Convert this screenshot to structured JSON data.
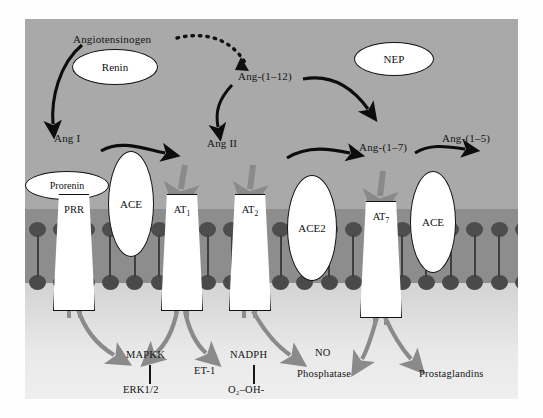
{
  "diagram": {
    "colors": {
      "panel_bg": "#a8a8a8",
      "membrane_band": "#8d8d8d",
      "lipid_head": "#4d4d4d",
      "cytoplasm": "#e9e9e9",
      "black_arrow": "#0d0d0d",
      "gray_arrow": "#8a8a8a"
    },
    "substrates": [
      {
        "id": "angiotensinogen",
        "label": "Angiotensinogen"
      },
      {
        "id": "ang_1_12",
        "label": "Ang-(1–12)"
      },
      {
        "id": "ang_i",
        "label": "Ang I"
      },
      {
        "id": "ang_ii",
        "label": "Ang II"
      },
      {
        "id": "ang_1_7",
        "label": "Ang-(1–7)"
      },
      {
        "id": "ang_1_5",
        "label": "Ang-(1–5)"
      }
    ],
    "enzymes": [
      {
        "id": "renin",
        "label": "Renin",
        "shape": "ellipse"
      },
      {
        "id": "nep",
        "label": "NEP",
        "shape": "ellipse"
      },
      {
        "id": "prorenin",
        "label": "Prorenin",
        "shape": "ellipse-outline"
      },
      {
        "id": "ace_left",
        "label": "ACE",
        "shape": "ellipse"
      },
      {
        "id": "ace2",
        "label": "ACE2",
        "shape": "ellipse"
      },
      {
        "id": "ace_right",
        "label": "ACE",
        "shape": "ellipse"
      }
    ],
    "receptors": [
      {
        "id": "prr",
        "label": "PRR",
        "sub": ""
      },
      {
        "id": "at1",
        "label": "AT",
        "sub": "1"
      },
      {
        "id": "at2",
        "label": "AT",
        "sub": "2"
      },
      {
        "id": "at7",
        "label": "AT",
        "sub": "7"
      }
    ],
    "downstream": [
      {
        "id": "mapkk",
        "label": "MAPKK"
      },
      {
        "id": "erk",
        "label": "ERK1/2"
      },
      {
        "id": "et1",
        "label": "ET-1"
      },
      {
        "id": "nadph",
        "label": "NADPH"
      },
      {
        "id": "superoxide",
        "label": "O₂–OH-"
      },
      {
        "id": "no",
        "label": "NO"
      },
      {
        "id": "phosphatase",
        "label": "Phosphatase"
      },
      {
        "id": "prostaglandins",
        "label": "Prostaglandins"
      }
    ]
  }
}
